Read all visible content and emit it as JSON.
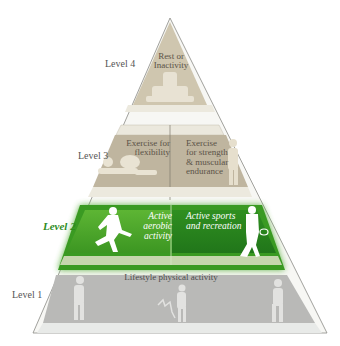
{
  "diagram": {
    "type": "pyramid",
    "highlighted_level": "Level 2",
    "colors": {
      "outline": "#8a8a85",
      "level4_fill": "#cdc4ae",
      "level3_fill": "#bdb39d",
      "level3_band": "#e8e4d6",
      "level2_fill": "#4ea52c",
      "level2_dark": "#2f8a1c",
      "level2_band": "#c8d8b0",
      "level1_fill": "#b8b8b8",
      "level1_band": "#e6e8e6",
      "active_label": "#2e8b1e"
    },
    "levels": [
      {
        "label": "Level 4",
        "boxes": [
          {
            "text_lines": [
              "Rest or",
              "Inactivity"
            ],
            "icon": "person-on-couch-icon"
          }
        ]
      },
      {
        "label": "Level 3",
        "boxes": [
          {
            "text_lines": [
              "Exercise for",
              "flexibility"
            ],
            "icon": "stretching-person-icon"
          },
          {
            "text_lines": [
              "Exercise",
              "for strength",
              "& muscular",
              "endurance"
            ],
            "icon": "standing-person-icon"
          }
        ]
      },
      {
        "label": "Level 2",
        "boxes": [
          {
            "text_lines": [
              "Active",
              "aerobic activity"
            ],
            "icon": "runner-icon"
          },
          {
            "text_lines": [
              "Active sports",
              "and recreation"
            ],
            "icon": "tennis-player-icon"
          }
        ]
      },
      {
        "label": "Level 1",
        "boxes": [
          {
            "text_lines": [
              "Lifestyle physical activity"
            ],
            "icon": "walking-people-icon"
          }
        ]
      }
    ]
  }
}
